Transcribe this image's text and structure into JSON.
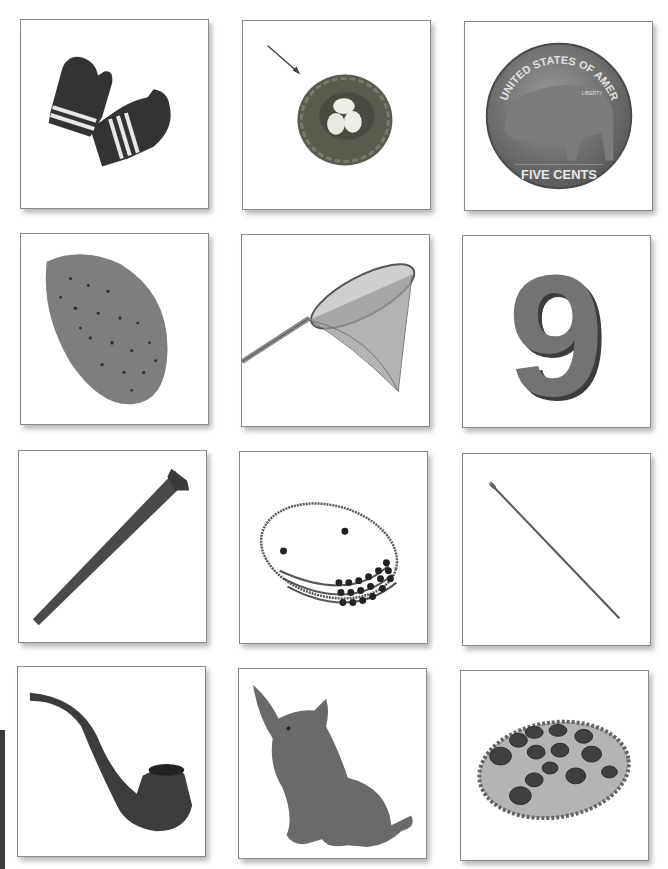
{
  "grid": {
    "rows": 4,
    "columns": 3,
    "cards": [
      {
        "row": 1,
        "col": 1,
        "label": "mittens",
        "icon": "mittens-icon"
      },
      {
        "row": 1,
        "col": 2,
        "label": "nest",
        "icon": "nest-icon",
        "has_arrow": true
      },
      {
        "row": 1,
        "col": 3,
        "label": "nickel",
        "icon": "nickel-coin-icon",
        "coin_text_top": "UNITED STATES OF AMERICA",
        "coin_text_bottom": "FIVE CENTS",
        "coin_text_small": "LIBERTY"
      },
      {
        "row": 2,
        "col": 1,
        "label": "nut",
        "icon": "almond-nut-icon"
      },
      {
        "row": 2,
        "col": 2,
        "label": "net",
        "icon": "butterfly-net-icon"
      },
      {
        "row": 2,
        "col": 3,
        "label": "nine",
        "icon": "number-nine-icon",
        "numeral": "9"
      },
      {
        "row": 3,
        "col": 1,
        "label": "nail",
        "icon": "nail-icon"
      },
      {
        "row": 3,
        "col": 2,
        "label": "necklace",
        "icon": "necklace-icon"
      },
      {
        "row": 3,
        "col": 3,
        "label": "needle",
        "icon": "needle-icon"
      },
      {
        "row": 4,
        "col": 1,
        "label": "pipe",
        "icon": "pipe-icon"
      },
      {
        "row": 4,
        "col": 2,
        "label": "pig",
        "icon": "pig-icon"
      },
      {
        "row": 4,
        "col": 3,
        "label": "pizza",
        "icon": "pizza-icon"
      }
    ]
  },
  "colors": {
    "card_border": "#8a8a8a",
    "background": "#ffffff",
    "side_tab": "#3a3a3a",
    "object_dark": "#333333",
    "object_mid": "#6e6e6e"
  }
}
